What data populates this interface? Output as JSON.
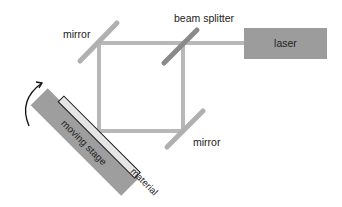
{
  "diagram": {
    "labels": {
      "mirror_top": "mirror",
      "beam_splitter": "beam splitter",
      "laser": "laser",
      "mirror_bottom": "mirror",
      "moving_stage": "moving stage",
      "material": "material"
    },
    "colors": {
      "beam": "#b8b8b8",
      "mirror": "#b0b0b0",
      "beam_splitter": "#8a8a8a",
      "laser_fill": "#9c9c9c",
      "stage_fill": "#9e9e9e",
      "material_fill": "#e6e6e6",
      "material_stroke": "#111111",
      "arrow": "#111111"
    }
  }
}
